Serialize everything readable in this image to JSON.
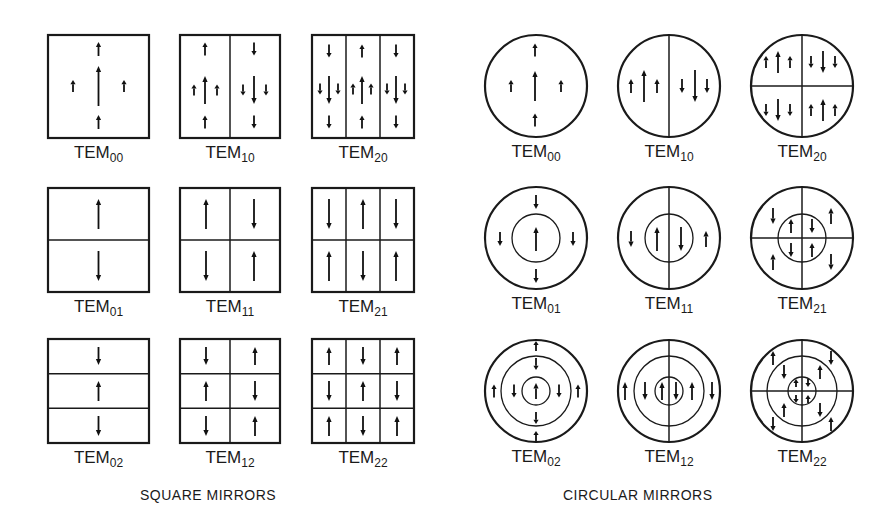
{
  "captions": {
    "square": "SQUARE MIRRORS",
    "circular": "CIRCULAR MIRRORS"
  },
  "label_prefix": "TEM",
  "square_modes": [
    {
      "name": "TEM00",
      "sub": "00",
      "x": 48,
      "y": 35,
      "w": 101,
      "h": 103,
      "cols": 1,
      "rows": 1,
      "arrows": [
        {
          "x": 98.5,
          "y": 86,
          "len": 40,
          "dir": "up"
        },
        {
          "x": 98.5,
          "y": 49,
          "len": 14,
          "dir": "up"
        },
        {
          "x": 98.5,
          "y": 122,
          "len": 14,
          "dir": "up"
        },
        {
          "x": 73,
          "y": 86,
          "len": 12,
          "dir": "up"
        },
        {
          "x": 124,
          "y": 86,
          "len": 12,
          "dir": "up"
        }
      ]
    },
    {
      "name": "TEM10",
      "sub": "10",
      "x": 180,
      "y": 35,
      "w": 100,
      "h": 103,
      "cols": 2,
      "rows": 1,
      "arrows": [
        {
          "x": 205,
          "y": 90,
          "len": 28,
          "dir": "up"
        },
        {
          "x": 205,
          "y": 49,
          "len": 13,
          "dir": "up"
        },
        {
          "x": 205,
          "y": 122,
          "len": 13,
          "dir": "up"
        },
        {
          "x": 194,
          "y": 90,
          "len": 11,
          "dir": "up"
        },
        {
          "x": 217,
          "y": 90,
          "len": 11,
          "dir": "up"
        },
        {
          "x": 254,
          "y": 90,
          "len": 28,
          "dir": "down"
        },
        {
          "x": 254,
          "y": 49,
          "len": 13,
          "dir": "down"
        },
        {
          "x": 254,
          "y": 122,
          "len": 13,
          "dir": "down"
        },
        {
          "x": 243,
          "y": 90,
          "len": 11,
          "dir": "down"
        },
        {
          "x": 266,
          "y": 90,
          "len": 11,
          "dir": "down"
        }
      ]
    },
    {
      "name": "TEM20",
      "sub": "20",
      "x": 312,
      "y": 35,
      "w": 102,
      "h": 103,
      "cols": 3,
      "rows": 1,
      "arrows": [
        {
          "x": 329,
          "y": 90,
          "len": 28,
          "dir": "down"
        },
        {
          "x": 329,
          "y": 51,
          "len": 13,
          "dir": "down"
        },
        {
          "x": 329,
          "y": 122,
          "len": 13,
          "dir": "down"
        },
        {
          "x": 320,
          "y": 89,
          "len": 11,
          "dir": "down"
        },
        {
          "x": 338,
          "y": 89,
          "len": 11,
          "dir": "down"
        },
        {
          "x": 362,
          "y": 90,
          "len": 28,
          "dir": "up"
        },
        {
          "x": 362,
          "y": 51,
          "len": 13,
          "dir": "up"
        },
        {
          "x": 362,
          "y": 122,
          "len": 13,
          "dir": "up"
        },
        {
          "x": 353,
          "y": 89,
          "len": 11,
          "dir": "up"
        },
        {
          "x": 371,
          "y": 89,
          "len": 11,
          "dir": "up"
        },
        {
          "x": 396,
          "y": 90,
          "len": 28,
          "dir": "down"
        },
        {
          "x": 396,
          "y": 51,
          "len": 13,
          "dir": "down"
        },
        {
          "x": 396,
          "y": 122,
          "len": 13,
          "dir": "down"
        },
        {
          "x": 387,
          "y": 89,
          "len": 11,
          "dir": "down"
        },
        {
          "x": 405,
          "y": 89,
          "len": 11,
          "dir": "down"
        }
      ]
    },
    {
      "name": "TEM01",
      "sub": "01",
      "x": 48,
      "y": 188,
      "w": 101,
      "h": 104,
      "cols": 1,
      "rows": 2,
      "arrows": [
        {
          "x": 98.5,
          "y": 214,
          "len": 30,
          "dir": "up"
        },
        {
          "x": 98.5,
          "y": 266,
          "len": 30,
          "dir": "down"
        }
      ]
    },
    {
      "name": "TEM11",
      "sub": "11",
      "x": 180,
      "y": 188,
      "w": 100,
      "h": 104,
      "cols": 2,
      "rows": 2,
      "arrows": [
        {
          "x": 206,
          "y": 214,
          "len": 30,
          "dir": "up"
        },
        {
          "x": 254,
          "y": 214,
          "len": 30,
          "dir": "down"
        },
        {
          "x": 206,
          "y": 266,
          "len": 30,
          "dir": "down"
        },
        {
          "x": 254,
          "y": 266,
          "len": 30,
          "dir": "up"
        }
      ]
    },
    {
      "name": "TEM21",
      "sub": "21",
      "x": 312,
      "y": 188,
      "w": 102,
      "h": 104,
      "cols": 3,
      "rows": 2,
      "arrows": [
        {
          "x": 329,
          "y": 214,
          "len": 30,
          "dir": "down"
        },
        {
          "x": 363,
          "y": 214,
          "len": 30,
          "dir": "up"
        },
        {
          "x": 396,
          "y": 214,
          "len": 30,
          "dir": "down"
        },
        {
          "x": 329,
          "y": 266,
          "len": 30,
          "dir": "up"
        },
        {
          "x": 363,
          "y": 266,
          "len": 30,
          "dir": "down"
        },
        {
          "x": 396,
          "y": 266,
          "len": 30,
          "dir": "up"
        }
      ]
    },
    {
      "name": "TEM02",
      "sub": "02",
      "x": 48,
      "y": 339,
      "w": 101,
      "h": 104,
      "cols": 1,
      "rows": 3,
      "arrows": [
        {
          "x": 98.5,
          "y": 356,
          "len": 18,
          "dir": "down"
        },
        {
          "x": 98.5,
          "y": 391,
          "len": 20,
          "dir": "up"
        },
        {
          "x": 98.5,
          "y": 426,
          "len": 20,
          "dir": "down"
        }
      ]
    },
    {
      "name": "TEM12",
      "sub": "12",
      "x": 180,
      "y": 339,
      "w": 100,
      "h": 104,
      "cols": 2,
      "rows": 3,
      "arrows": [
        {
          "x": 206,
          "y": 356,
          "len": 18,
          "dir": "down"
        },
        {
          "x": 255,
          "y": 356,
          "len": 18,
          "dir": "up"
        },
        {
          "x": 206,
          "y": 391,
          "len": 20,
          "dir": "up"
        },
        {
          "x": 255,
          "y": 391,
          "len": 20,
          "dir": "down"
        },
        {
          "x": 206,
          "y": 426,
          "len": 20,
          "dir": "down"
        },
        {
          "x": 255,
          "y": 426,
          "len": 20,
          "dir": "up"
        }
      ]
    },
    {
      "name": "TEM22",
      "sub": "22",
      "x": 312,
      "y": 339,
      "w": 102,
      "h": 104,
      "cols": 3,
      "rows": 3,
      "arrows": [
        {
          "x": 329,
          "y": 356,
          "len": 18,
          "dir": "up"
        },
        {
          "x": 363,
          "y": 356,
          "len": 18,
          "dir": "down"
        },
        {
          "x": 397,
          "y": 356,
          "len": 18,
          "dir": "up"
        },
        {
          "x": 329,
          "y": 391,
          "len": 20,
          "dir": "down"
        },
        {
          "x": 363,
          "y": 391,
          "len": 20,
          "dir": "up"
        },
        {
          "x": 397,
          "y": 391,
          "len": 20,
          "dir": "down"
        },
        {
          "x": 329,
          "y": 426,
          "len": 20,
          "dir": "up"
        },
        {
          "x": 363,
          "y": 426,
          "len": 20,
          "dir": "down"
        },
        {
          "x": 397,
          "y": 426,
          "len": 20,
          "dir": "up"
        }
      ]
    }
  ],
  "circular_modes": [
    {
      "name": "TEM00",
      "sub": "00",
      "cx": 536,
      "cy": 86,
      "r": 51,
      "rings": [],
      "vline": false,
      "hline": false,
      "arrows": [
        {
          "x": 535,
          "y": 86,
          "len": 30,
          "dir": "up"
        },
        {
          "x": 535,
          "y": 50,
          "len": 13,
          "dir": "up"
        },
        {
          "x": 535,
          "y": 120,
          "len": 13,
          "dir": "up"
        },
        {
          "x": 511,
          "y": 86,
          "len": 12,
          "dir": "up"
        },
        {
          "x": 561,
          "y": 86,
          "len": 12,
          "dir": "up"
        }
      ]
    },
    {
      "name": "TEM10",
      "sub": "10",
      "cx": 669,
      "cy": 86,
      "r": 51,
      "rings": [],
      "vline": true,
      "hline": false,
      "arrows": [
        {
          "x": 644,
          "y": 86,
          "len": 32,
          "dir": "up"
        },
        {
          "x": 631,
          "y": 86,
          "len": 14,
          "dir": "up"
        },
        {
          "x": 657,
          "y": 86,
          "len": 14,
          "dir": "up"
        },
        {
          "x": 695,
          "y": 86,
          "len": 32,
          "dir": "down"
        },
        {
          "x": 682,
          "y": 86,
          "len": 14,
          "dir": "down"
        },
        {
          "x": 707,
          "y": 86,
          "len": 14,
          "dir": "down"
        }
      ]
    },
    {
      "name": "TEM20",
      "sub": "20",
      "cx": 802,
      "cy": 86,
      "r": 51,
      "rings": [],
      "vline": true,
      "hline": true,
      "arrows": [
        {
          "x": 778,
          "y": 62,
          "len": 22,
          "dir": "up"
        },
        {
          "x": 766,
          "y": 62,
          "len": 12,
          "dir": "up"
        },
        {
          "x": 790,
          "y": 62,
          "len": 12,
          "dir": "up"
        },
        {
          "x": 823,
          "y": 62,
          "len": 22,
          "dir": "down"
        },
        {
          "x": 811,
          "y": 62,
          "len": 12,
          "dir": "down"
        },
        {
          "x": 835,
          "y": 62,
          "len": 12,
          "dir": "down"
        },
        {
          "x": 778,
          "y": 110,
          "len": 22,
          "dir": "down"
        },
        {
          "x": 766,
          "y": 110,
          "len": 12,
          "dir": "down"
        },
        {
          "x": 790,
          "y": 110,
          "len": 12,
          "dir": "down"
        },
        {
          "x": 823,
          "y": 110,
          "len": 22,
          "dir": "up"
        },
        {
          "x": 811,
          "y": 110,
          "len": 12,
          "dir": "up"
        },
        {
          "x": 835,
          "y": 110,
          "len": 12,
          "dir": "up"
        }
      ]
    },
    {
      "name": "TEM01",
      "sub": "01",
      "cx": 536,
      "cy": 238,
      "r": 51,
      "rings": [
        24
      ],
      "vline": false,
      "hline": false,
      "arrows": [
        {
          "x": 536,
          "y": 239,
          "len": 24,
          "dir": "up"
        },
        {
          "x": 536,
          "y": 202,
          "len": 14,
          "dir": "down"
        },
        {
          "x": 536,
          "y": 276,
          "len": 14,
          "dir": "down"
        },
        {
          "x": 500,
          "y": 239,
          "len": 14,
          "dir": "down"
        },
        {
          "x": 573,
          "y": 239,
          "len": 14,
          "dir": "down"
        }
      ]
    },
    {
      "name": "TEM11",
      "sub": "11",
      "cx": 669,
      "cy": 238,
      "r": 51,
      "rings": [
        24
      ],
      "vline": true,
      "hline": false,
      "arrows": [
        {
          "x": 657,
          "y": 239,
          "len": 24,
          "dir": "up"
        },
        {
          "x": 681,
          "y": 239,
          "len": 24,
          "dir": "down"
        },
        {
          "x": 631,
          "y": 239,
          "len": 16,
          "dir": "down"
        },
        {
          "x": 706,
          "y": 239,
          "len": 16,
          "dir": "up"
        }
      ]
    },
    {
      "name": "TEM21",
      "sub": "21",
      "cx": 802,
      "cy": 238,
      "r": 51,
      "rings": [
        24
      ],
      "vline": true,
      "hline": true,
      "arrows": [
        {
          "x": 791,
          "y": 226,
          "len": 14,
          "dir": "up"
        },
        {
          "x": 812,
          "y": 226,
          "len": 14,
          "dir": "down"
        },
        {
          "x": 791,
          "y": 250,
          "len": 14,
          "dir": "down"
        },
        {
          "x": 812,
          "y": 250,
          "len": 14,
          "dir": "up"
        },
        {
          "x": 773,
          "y": 216,
          "len": 16,
          "dir": "down"
        },
        {
          "x": 831,
          "y": 216,
          "len": 16,
          "dir": "up"
        },
        {
          "x": 773,
          "y": 262,
          "len": 16,
          "dir": "up"
        },
        {
          "x": 831,
          "y": 262,
          "len": 16,
          "dir": "down"
        }
      ]
    },
    {
      "name": "TEM02",
      "sub": "02",
      "cx": 536,
      "cy": 391,
      "r": 51,
      "rings": [
        35,
        14
      ],
      "vline": false,
      "hline": false,
      "arrows": [
        {
          "x": 536,
          "y": 391,
          "len": 16,
          "dir": "up"
        },
        {
          "x": 536,
          "y": 364,
          "len": 12,
          "dir": "down"
        },
        {
          "x": 536,
          "y": 418,
          "len": 12,
          "dir": "down"
        },
        {
          "x": 514,
          "y": 391,
          "len": 13,
          "dir": "down"
        },
        {
          "x": 559,
          "y": 391,
          "len": 13,
          "dir": "down"
        },
        {
          "x": 536,
          "y": 346,
          "len": 10,
          "dir": "up"
        },
        {
          "x": 536,
          "y": 436,
          "len": 10,
          "dir": "up"
        },
        {
          "x": 494,
          "y": 391,
          "len": 13,
          "dir": "up"
        },
        {
          "x": 578,
          "y": 391,
          "len": 13,
          "dir": "up"
        }
      ]
    },
    {
      "name": "TEM12",
      "sub": "12",
      "cx": 669,
      "cy": 391,
      "r": 51,
      "rings": [
        35,
        14
      ],
      "vline": true,
      "hline": false,
      "arrows": [
        {
          "x": 662,
          "y": 391,
          "len": 18,
          "dir": "up"
        },
        {
          "x": 676,
          "y": 391,
          "len": 18,
          "dir": "down"
        },
        {
          "x": 645,
          "y": 391,
          "len": 18,
          "dir": "down"
        },
        {
          "x": 692,
          "y": 391,
          "len": 18,
          "dir": "up"
        },
        {
          "x": 625,
          "y": 391,
          "len": 18,
          "dir": "up"
        },
        {
          "x": 712,
          "y": 391,
          "len": 18,
          "dir": "down"
        }
      ]
    },
    {
      "name": "TEM22",
      "sub": "22",
      "cx": 802,
      "cy": 391,
      "r": 51,
      "rings": [
        35,
        14
      ],
      "vline": true,
      "hline": true,
      "arrows": [
        {
          "x": 796,
          "y": 383,
          "len": 8,
          "dir": "up"
        },
        {
          "x": 808,
          "y": 383,
          "len": 8,
          "dir": "down"
        },
        {
          "x": 796,
          "y": 399,
          "len": 8,
          "dir": "down"
        },
        {
          "x": 808,
          "y": 399,
          "len": 8,
          "dir": "up"
        },
        {
          "x": 784,
          "y": 372,
          "len": 14,
          "dir": "down"
        },
        {
          "x": 820,
          "y": 372,
          "len": 14,
          "dir": "up"
        },
        {
          "x": 784,
          "y": 410,
          "len": 14,
          "dir": "up"
        },
        {
          "x": 820,
          "y": 410,
          "len": 14,
          "dir": "down"
        },
        {
          "x": 773,
          "y": 358,
          "len": 14,
          "dir": "up"
        },
        {
          "x": 831,
          "y": 358,
          "len": 14,
          "dir": "down"
        },
        {
          "x": 773,
          "y": 424,
          "len": 14,
          "dir": "down"
        },
        {
          "x": 831,
          "y": 424,
          "len": 14,
          "dir": "up"
        }
      ]
    }
  ],
  "layout": {
    "square_label_offset": 20,
    "circle_label_offset": 20,
    "caption_y": 500,
    "square_caption_x": 140,
    "circular_caption_x": 563
  }
}
